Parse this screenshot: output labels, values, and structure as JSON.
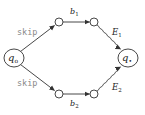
{
  "diagram": {
    "type": "automaton",
    "colors": {
      "stroke": "#333333",
      "label": "#222222",
      "mono_label": "#8a8a8a",
      "background": "#ffffff"
    },
    "nodes": [
      {
        "id": "q0",
        "label": "q",
        "sub": "o",
        "kind": "state",
        "x": 14,
        "y": 58,
        "r": 9
      },
      {
        "id": "qf",
        "label": "q",
        "sub": "•",
        "kind": "state",
        "x": 128,
        "y": 58,
        "r": 9
      },
      {
        "id": "u1",
        "kind": "small",
        "x": 59,
        "y": 22,
        "r": 4
      },
      {
        "id": "u2",
        "kind": "small",
        "x": 94,
        "y": 22,
        "r": 4
      },
      {
        "id": "l1",
        "kind": "small",
        "x": 59,
        "y": 94,
        "r": 4
      },
      {
        "id": "l2",
        "kind": "small",
        "x": 94,
        "y": 94,
        "r": 4
      }
    ],
    "edges": [
      {
        "from": "q0",
        "to": "u1",
        "style": "straight",
        "label": "skip"
      },
      {
        "from": "q0",
        "to": "l1",
        "style": "straight",
        "label": "skip"
      },
      {
        "from": "u1",
        "to": "u2",
        "style": "straight",
        "label": "b",
        "label_sub": "1"
      },
      {
        "from": "l1",
        "to": "l2",
        "style": "straight",
        "label": "b",
        "label_sub": "2"
      },
      {
        "from": "u2",
        "to": "qf",
        "style": "wavy",
        "label": "E",
        "label_sub": "1"
      },
      {
        "from": "l2",
        "to": "qf",
        "style": "wavy",
        "label": "E",
        "label_sub": "2"
      }
    ],
    "labels": {
      "skip_top": "skip",
      "skip_bottom": "skip",
      "q0_main": "q",
      "q0_sub": "o",
      "qf_main": "q",
      "qf_sub": "•",
      "b1_main": "b",
      "b1_sub": "1",
      "b2_main": "b",
      "b2_sub": "2",
      "E1_main": "E",
      "E1_sub": "1",
      "E2_main": "E",
      "E2_sub": "2"
    }
  }
}
